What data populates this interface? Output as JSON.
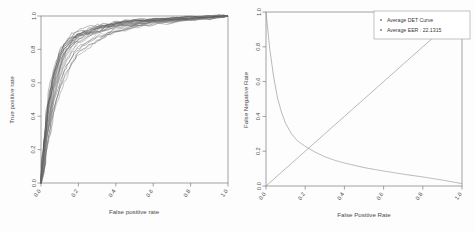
{
  "figure": {
    "background": "#fdfdfd",
    "panels": 2
  },
  "chart_data": [
    {
      "type": "line",
      "id": "roc",
      "title": "",
      "xlabel": "False positive rate",
      "ylabel": "True positive rate",
      "xlim": [
        0.0,
        1.0
      ],
      "ylim": [
        0.0,
        1.0
      ],
      "grid": false,
      "legend": null,
      "xticks": [
        "0.0",
        "0.2",
        "0.4",
        "0.6",
        "0.8",
        "1.0"
      ],
      "xtick_values": [
        0.0,
        0.2,
        0.4,
        0.6,
        0.8,
        1.0
      ],
      "yticks": [
        "0.0",
        "0.2",
        "0.4",
        "0.6",
        "0.8",
        "1.0"
      ],
      "ytick_values": [
        0.0,
        0.2,
        0.4,
        0.6,
        0.8,
        1.0
      ],
      "series_count": 26,
      "series_color": "#555555",
      "note": "Overlaid ROC curves for 26 folds/subjects",
      "x": [
        0.0,
        0.01,
        0.02,
        0.03,
        0.05,
        0.07,
        0.1,
        0.13,
        0.17,
        0.2,
        0.25,
        0.3,
        0.35,
        0.4,
        0.5,
        0.6,
        0.7,
        0.8,
        0.9,
        1.0
      ],
      "series": [
        {
          "name": "ROC 1",
          "values": [
            0.0,
            0.1,
            0.22,
            0.34,
            0.49,
            0.6,
            0.72,
            0.8,
            0.85,
            0.88,
            0.9,
            0.92,
            0.93,
            0.94,
            0.96,
            0.97,
            0.98,
            0.99,
            0.995,
            1.0
          ]
        },
        {
          "name": "ROC 2",
          "values": [
            0.0,
            0.08,
            0.18,
            0.29,
            0.43,
            0.55,
            0.67,
            0.76,
            0.82,
            0.85,
            0.88,
            0.9,
            0.92,
            0.93,
            0.95,
            0.96,
            0.975,
            0.985,
            0.993,
            1.0
          ]
        },
        {
          "name": "ROC 3",
          "values": [
            0.0,
            0.12,
            0.26,
            0.38,
            0.54,
            0.65,
            0.76,
            0.83,
            0.87,
            0.89,
            0.91,
            0.93,
            0.94,
            0.95,
            0.965,
            0.975,
            0.985,
            0.99,
            0.996,
            1.0
          ]
        },
        {
          "name": "ROC 4",
          "values": [
            0.0,
            0.06,
            0.15,
            0.24,
            0.37,
            0.48,
            0.6,
            0.7,
            0.77,
            0.81,
            0.85,
            0.88,
            0.9,
            0.915,
            0.94,
            0.955,
            0.97,
            0.98,
            0.99,
            1.0
          ]
        },
        {
          "name": "ROC 5",
          "values": [
            0.0,
            0.14,
            0.29,
            0.42,
            0.57,
            0.68,
            0.78,
            0.84,
            0.88,
            0.9,
            0.92,
            0.935,
            0.945,
            0.955,
            0.97,
            0.98,
            0.987,
            0.992,
            0.997,
            1.0
          ]
        },
        {
          "name": "ROC 6",
          "values": [
            0.0,
            0.09,
            0.2,
            0.31,
            0.46,
            0.57,
            0.69,
            0.78,
            0.83,
            0.86,
            0.89,
            0.91,
            0.925,
            0.935,
            0.955,
            0.968,
            0.978,
            0.987,
            0.994,
            1.0
          ]
        },
        {
          "name": "ROC 7",
          "values": [
            0.0,
            0.05,
            0.13,
            0.21,
            0.33,
            0.44,
            0.56,
            0.66,
            0.73,
            0.78,
            0.83,
            0.86,
            0.885,
            0.9,
            0.93,
            0.95,
            0.965,
            0.978,
            0.99,
            1.0
          ]
        },
        {
          "name": "ROC 8",
          "values": [
            0.0,
            0.11,
            0.24,
            0.36,
            0.51,
            0.62,
            0.74,
            0.81,
            0.86,
            0.885,
            0.905,
            0.925,
            0.938,
            0.948,
            0.963,
            0.974,
            0.983,
            0.99,
            0.995,
            1.0
          ]
        },
        {
          "name": "ROC 9",
          "values": [
            0.0,
            0.07,
            0.17,
            0.27,
            0.4,
            0.52,
            0.64,
            0.73,
            0.8,
            0.835,
            0.87,
            0.895,
            0.915,
            0.928,
            0.95,
            0.963,
            0.974,
            0.984,
            0.992,
            1.0
          ]
        },
        {
          "name": "ROC 10",
          "values": [
            0.0,
            0.13,
            0.27,
            0.4,
            0.55,
            0.66,
            0.77,
            0.835,
            0.875,
            0.895,
            0.915,
            0.932,
            0.943,
            0.952,
            0.968,
            0.977,
            0.986,
            0.991,
            0.996,
            1.0
          ]
        },
        {
          "name": "ROC 11",
          "values": [
            0.0,
            0.04,
            0.11,
            0.19,
            0.3,
            0.41,
            0.53,
            0.63,
            0.71,
            0.76,
            0.81,
            0.85,
            0.875,
            0.895,
            0.925,
            0.945,
            0.962,
            0.976,
            0.988,
            1.0
          ]
        },
        {
          "name": "ROC 12",
          "values": [
            0.0,
            0.1,
            0.21,
            0.33,
            0.48,
            0.59,
            0.71,
            0.79,
            0.845,
            0.872,
            0.895,
            0.915,
            0.93,
            0.94,
            0.958,
            0.97,
            0.98,
            0.988,
            0.994,
            1.0
          ]
        },
        {
          "name": "ROC 13",
          "values": [
            0.0,
            0.15,
            0.31,
            0.44,
            0.59,
            0.7,
            0.795,
            0.85,
            0.885,
            0.905,
            0.925,
            0.94,
            0.95,
            0.958,
            0.972,
            0.981,
            0.988,
            0.993,
            0.997,
            1.0
          ]
        },
        {
          "name": "ROC 14",
          "values": [
            0.0,
            0.08,
            0.19,
            0.3,
            0.44,
            0.56,
            0.68,
            0.765,
            0.825,
            0.855,
            0.885,
            0.908,
            0.923,
            0.935,
            0.955,
            0.967,
            0.978,
            0.986,
            0.993,
            1.0
          ]
        },
        {
          "name": "ROC 15",
          "values": [
            0.0,
            0.06,
            0.16,
            0.26,
            0.39,
            0.5,
            0.62,
            0.715,
            0.785,
            0.82,
            0.86,
            0.888,
            0.908,
            0.922,
            0.946,
            0.96,
            0.972,
            0.982,
            0.991,
            1.0
          ]
        },
        {
          "name": "ROC 16",
          "values": [
            0.0,
            0.12,
            0.25,
            0.37,
            0.52,
            0.635,
            0.748,
            0.82,
            0.865,
            0.888,
            0.91,
            0.928,
            0.94,
            0.95,
            0.965,
            0.976,
            0.985,
            0.991,
            0.996,
            1.0
          ]
        },
        {
          "name": "ROC 17",
          "values": [
            0.0,
            0.09,
            0.205,
            0.32,
            0.465,
            0.58,
            0.7,
            0.785,
            0.84,
            0.868,
            0.893,
            0.913,
            0.928,
            0.939,
            0.957,
            0.969,
            0.979,
            0.987,
            0.994,
            1.0
          ]
        },
        {
          "name": "ROC 18",
          "values": [
            0.0,
            0.135,
            0.285,
            0.415,
            0.565,
            0.675,
            0.782,
            0.843,
            0.88,
            0.9,
            0.92,
            0.936,
            0.947,
            0.955,
            0.97,
            0.979,
            0.987,
            0.992,
            0.997,
            1.0
          ]
        },
        {
          "name": "ROC 19",
          "values": [
            0.0,
            0.055,
            0.14,
            0.225,
            0.35,
            0.46,
            0.58,
            0.68,
            0.75,
            0.795,
            0.84,
            0.87,
            0.892,
            0.908,
            0.935,
            0.953,
            0.968,
            0.979,
            0.99,
            1.0
          ]
        },
        {
          "name": "ROC 20",
          "values": [
            0.0,
            0.105,
            0.23,
            0.35,
            0.5,
            0.61,
            0.725,
            0.8,
            0.852,
            0.878,
            0.9,
            0.92,
            0.934,
            0.944,
            0.961,
            0.972,
            0.982,
            0.989,
            0.995,
            1.0
          ]
        },
        {
          "name": "ROC 21",
          "values": [
            0.0,
            0.07,
            0.175,
            0.275,
            0.41,
            0.525,
            0.645,
            0.735,
            0.8,
            0.838,
            0.872,
            0.897,
            0.916,
            0.929,
            0.951,
            0.964,
            0.975,
            0.985,
            0.992,
            1.0
          ]
        },
        {
          "name": "ROC 22",
          "values": [
            0.0,
            0.125,
            0.265,
            0.39,
            0.54,
            0.65,
            0.762,
            0.828,
            0.87,
            0.892,
            0.913,
            0.93,
            0.942,
            0.951,
            0.966,
            0.976,
            0.985,
            0.991,
            0.996,
            1.0
          ]
        },
        {
          "name": "ROC 23",
          "values": [
            0.0,
            0.085,
            0.195,
            0.305,
            0.45,
            0.565,
            0.685,
            0.772,
            0.83,
            0.862,
            0.888,
            0.911,
            0.926,
            0.937,
            0.956,
            0.968,
            0.979,
            0.987,
            0.994,
            1.0
          ]
        },
        {
          "name": "ROC 24",
          "values": [
            0.0,
            0.045,
            0.12,
            0.2,
            0.315,
            0.425,
            0.545,
            0.65,
            0.725,
            0.772,
            0.822,
            0.856,
            0.88,
            0.898,
            0.928,
            0.948,
            0.964,
            0.977,
            0.989,
            1.0
          ]
        },
        {
          "name": "ROC 25",
          "values": [
            0.0,
            0.145,
            0.3,
            0.43,
            0.58,
            0.69,
            0.79,
            0.847,
            0.883,
            0.903,
            0.922,
            0.938,
            0.949,
            0.957,
            0.971,
            0.98,
            0.988,
            0.993,
            0.997,
            1.0
          ]
        },
        {
          "name": "ROC 26",
          "values": [
            0.0,
            0.095,
            0.215,
            0.335,
            0.48,
            0.595,
            0.712,
            0.792,
            0.847,
            0.875,
            0.898,
            0.918,
            0.932,
            0.942,
            0.96,
            0.971,
            0.981,
            0.988,
            0.995,
            1.0
          ]
        }
      ]
    },
    {
      "type": "line",
      "id": "det",
      "title": "",
      "xlabel": "False Positive Rate",
      "ylabel": "False Negative Rate",
      "xlim": [
        0.0,
        1.0
      ],
      "ylim": [
        0.0,
        1.0
      ],
      "grid": false,
      "legend_position": "top-right",
      "xticks": [
        "0.0",
        "0.2",
        "0.4",
        "0.6",
        "0.8",
        "1.0"
      ],
      "xtick_values": [
        0.0,
        0.2,
        0.4,
        0.6,
        0.8,
        1.0
      ],
      "yticks": [
        "0.0",
        "0.2",
        "0.4",
        "0.6",
        "0.8",
        "1.0"
      ],
      "ytick_values": [
        0.0,
        0.2,
        0.4,
        0.6,
        0.8,
        1.0
      ],
      "eer_value": 22.1315,
      "eer_point": [
        0.221,
        0.221
      ],
      "x": [
        0.0,
        0.02,
        0.04,
        0.06,
        0.08,
        0.1,
        0.13,
        0.16,
        0.2,
        0.25,
        0.3,
        0.35,
        0.4,
        0.5,
        0.6,
        0.7,
        0.8,
        0.9,
        1.0
      ],
      "series": [
        {
          "name": "Average DET Curve",
          "values": [
            1.0,
            0.78,
            0.62,
            0.5,
            0.42,
            0.36,
            0.3,
            0.26,
            0.228,
            0.195,
            0.168,
            0.148,
            0.132,
            0.106,
            0.086,
            0.068,
            0.052,
            0.034,
            0.014
          ]
        },
        {
          "name": "Average EER : 22.1315",
          "values": [
            0.0,
            0.02,
            0.04,
            0.06,
            0.08,
            0.1,
            0.13,
            0.16,
            0.2,
            0.25,
            0.3,
            0.35,
            0.4,
            0.5,
            0.6,
            0.7,
            0.8,
            0.9,
            1.0
          ]
        }
      ],
      "legend": [
        {
          "label": "Average DET Curve",
          "marker": "dot",
          "color": "#8a8a8a"
        },
        {
          "label": "Average EER :  22.1315",
          "marker": "dot",
          "color": "#8a8a8a"
        }
      ]
    }
  ]
}
